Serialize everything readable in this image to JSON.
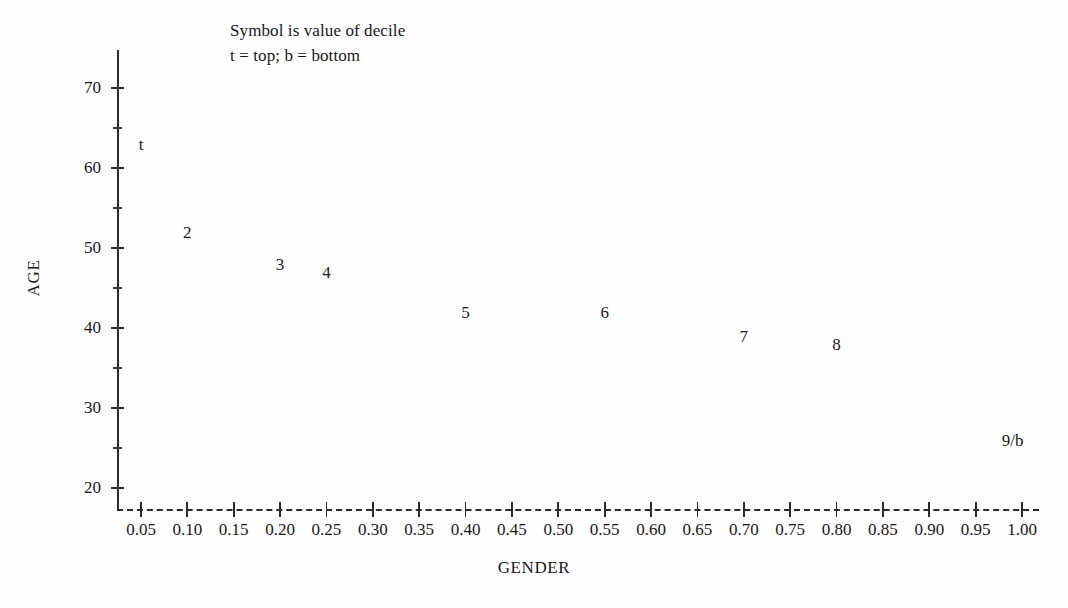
{
  "chart_data": {
    "type": "scatter",
    "title": "",
    "xlabel": "GENDER",
    "ylabel": "AGE",
    "xlim": [
      0.0,
      1.025
    ],
    "ylim": [
      17.5,
      73.5
    ],
    "grid": false,
    "legend": null,
    "annotations": [
      "Symbol is value of decile",
      "t = top; b = bottom"
    ],
    "point_label_note": "Symbol plotted is the decile value; t = top decile, b = bottom decile",
    "x_tick_labels": [
      "0.05",
      "0.10",
      "0.15",
      "0.20",
      "0.25",
      "0.30",
      "0.35",
      "0.40",
      "0.45",
      "0.50",
      "0.55",
      "0.60",
      "0.65",
      "0.70",
      "0.75",
      "0.80",
      "0.85",
      "0.90",
      "0.95",
      "1.00"
    ],
    "x_tick_values": [
      0.05,
      0.1,
      0.15,
      0.2,
      0.25,
      0.3,
      0.35,
      0.4,
      0.45,
      0.5,
      0.55,
      0.6,
      0.65,
      0.7,
      0.75,
      0.8,
      0.85,
      0.9,
      0.95,
      1.0
    ],
    "y_tick_labels": [
      "20",
      "30",
      "40",
      "50",
      "60",
      "70"
    ],
    "y_tick_values": [
      20,
      30,
      40,
      50,
      60,
      70
    ],
    "y_minor_tick_values": [
      25,
      35,
      45,
      55,
      65
    ],
    "points": [
      {
        "label": "t",
        "x": 0.05,
        "y": 63
      },
      {
        "label": "2",
        "x": 0.1,
        "y": 52
      },
      {
        "label": "3",
        "x": 0.2,
        "y": 48
      },
      {
        "label": "4",
        "x": 0.25,
        "y": 47
      },
      {
        "label": "5",
        "x": 0.4,
        "y": 42
      },
      {
        "label": "6",
        "x": 0.55,
        "y": 42
      },
      {
        "label": "7",
        "x": 0.7,
        "y": 39
      },
      {
        "label": "8",
        "x": 0.8,
        "y": 38
      },
      {
        "label": "9/b",
        "x": 0.99,
        "y": 26
      }
    ],
    "colors": {
      "axis": "#2b2b2b",
      "text": "#181818",
      "background": "#fefefe"
    }
  }
}
